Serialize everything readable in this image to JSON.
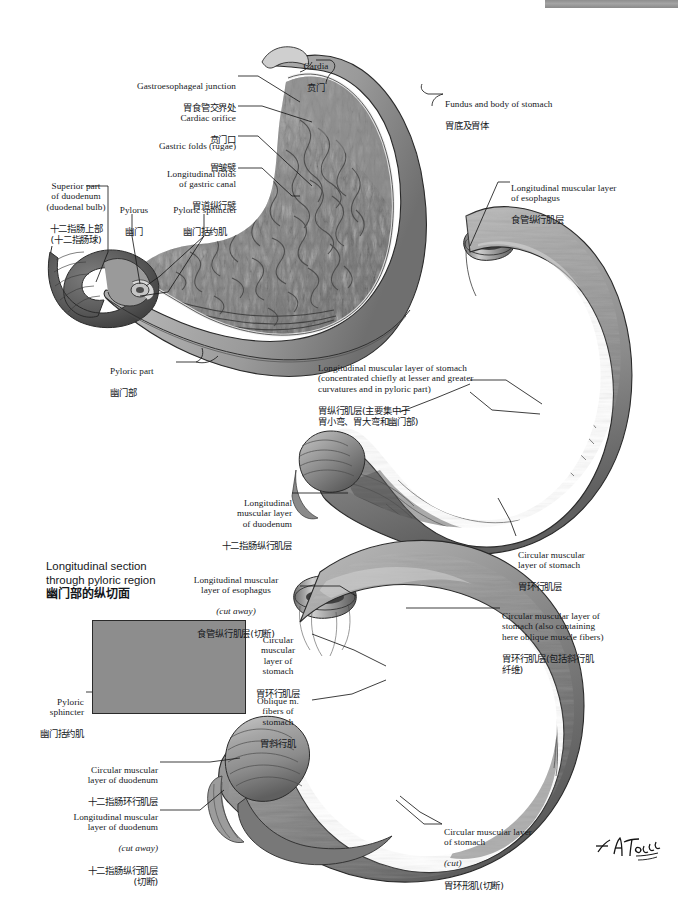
{
  "plate": {
    "domain_note": "Netter-style anatomical atlas plate: musculature of stomach and duodenum, bilingual English / Simplified Chinese labels",
    "signature": "F. Netter"
  },
  "top_strip": {
    "present": true,
    "color": "#949494"
  },
  "section_headings": [
    {
      "id": "longitudinal-section-title",
      "en": "Longitudinal section\nthrough pyloric region",
      "cn": "幽门部的纵切面",
      "x": 46,
      "y": 560
    }
  ],
  "labels": [
    {
      "id": "gastroesophageal-junction",
      "en": "Gastroesophageal junction",
      "cn": "胃食管交界处",
      "align": "right",
      "x": 118,
      "y": 70,
      "w": 118
    },
    {
      "id": "cardia",
      "en": "Cardia",
      "cn": "贲门",
      "align": "center",
      "x": 290,
      "y": 50,
      "w": 52
    },
    {
      "id": "fundus-and-body-of-stomach",
      "en": "Fundus and body of stomach",
      "cn": "胃底及胃体",
      "align": "left",
      "x": 445,
      "y": 88,
      "w": 130
    },
    {
      "id": "cardiac-orifice",
      "en": "Cardiac orifice",
      "cn": "贲门口",
      "align": "right",
      "x": 150,
      "y": 102,
      "w": 86
    },
    {
      "id": "gastric-folds-rugae",
      "en": "Gastric folds (rugae)",
      "cn": "胃皱襞",
      "align": "right",
      "x": 140,
      "y": 132,
      "w": 96
    },
    {
      "id": "longitudinal-folds-of-gastric-canal",
      "en": "Longitudinal folds\nof gastric canal",
      "cn": "胃道纵行襞",
      "align": "right",
      "x": 128,
      "y": 159,
      "w": 108
    },
    {
      "id": "superior-part-of-duodenum",
      "en": "Superior part\nof duodenum\n(duodenal bulb)",
      "cn": "十二指肠上部\n(十二指肠球)",
      "align": "center",
      "x": 38,
      "y": 172,
      "w": 78
    },
    {
      "id": "longitudinal-muscular-layer-of-esophagus-top",
      "en": "Longitudinal muscular layer\nof esophagus",
      "cn": "食管纵行肌层",
      "align": "left",
      "x": 511,
      "y": 172,
      "w": 150
    },
    {
      "id": "pylorus",
      "en": "Pylorus",
      "cn": "幽门",
      "align": "center",
      "x": 118,
      "y": 196,
      "w": 42
    },
    {
      "id": "pyloric-sphincter-top",
      "en": "Pyloric sphincter",
      "cn": "幽门括约肌",
      "align": "center",
      "x": 166,
      "y": 196,
      "w": 80
    },
    {
      "id": "pyloric-part",
      "en": "Pyloric part",
      "cn": "幽门部",
      "align": "left",
      "x": 110,
      "y": 357,
      "w": 66
    },
    {
      "id": "longitudinal-muscular-layer-of-stomach",
      "en": "Longitudinal muscular layer of stomach\n(concentrated chiefly at lesser and greater\ncurvatures and in pyloric part)",
      "cn": "胃纵行肌层(主要集中于\n胃小弯、胃大弯和幽门部)",
      "align": "left",
      "x": 318,
      "y": 355,
      "w": 224
    },
    {
      "id": "longitudinal-muscular-layer-of-duodenum",
      "en": "Longitudinal\nmuscular layer\nof duodenum",
      "cn": "十二指肠纵行肌层",
      "align": "right",
      "x": 198,
      "y": 489,
      "w": 92
    },
    {
      "id": "circular-muscular-layer-of-stomach-right",
      "en": "Circular muscular\nlayer of stomach",
      "cn": "胃环行肌层",
      "align": "left",
      "x": 518,
      "y": 541,
      "w": 104
    },
    {
      "id": "longitudinal-muscular-layer-of-esophagus-cut",
      "en": "Longitudinal muscular\nlayer of esophagus",
      "en_italic": "(cut away)",
      "cn": "食管纵行肌层(切断)",
      "align": "center",
      "x": 176,
      "y": 566,
      "w": 120
    },
    {
      "id": "circular-muscular-layer-of-stomach-oblique",
      "en": "Circular muscular layer of\nstomach (also containing\nhere oblique muscle fibers)",
      "cn": "胃环行肌层(包括斜行肌\n纤维)",
      "align": "left",
      "x": 502,
      "y": 602,
      "w": 168
    },
    {
      "id": "circular-muscular-layer-of-stomach-mid",
      "en": "Circular\nmuscular\nlayer of\nstomach",
      "cn": "胃环行肌层",
      "align": "center",
      "x": 244,
      "y": 626,
      "w": 70
    },
    {
      "id": "pyloric-sphincter-inset",
      "en": "Pyloric\nsphincter",
      "cn": "幽门括约肌",
      "align": "right",
      "x": 18,
      "y": 688,
      "w": 66
    },
    {
      "id": "oblique-m-fibers-of-stomach",
      "en": "Oblique m.\nfibers of\nstomach",
      "cn": "胃斜行肌",
      "align": "center",
      "x": 244,
      "y": 687,
      "w": 70
    },
    {
      "id": "circular-muscular-layer-of-duodenum",
      "en": "Circular muscular\nlayer of duodenum",
      "cn": "十二指肠环行肌层",
      "align": "right",
      "x": 50,
      "y": 756,
      "w": 108
    },
    {
      "id": "longitudinal-muscular-layer-of-duodenum-cut",
      "en": "Longitudinal muscular\nlayer of duodenum",
      "en_italic": "(cut away)",
      "cn": "十二指肠纵行肌层\n(切断)",
      "align": "right",
      "x": 30,
      "y": 803,
      "w": 128
    },
    {
      "id": "circular-muscular-layer-of-stomach-cut",
      "en": "Circular muscular layer\nof stomach",
      "en_italic": "(cut)",
      "cn": "胃环形肌(切断)",
      "align": "left",
      "x": 444,
      "y": 818,
      "w": 146
    }
  ]
}
